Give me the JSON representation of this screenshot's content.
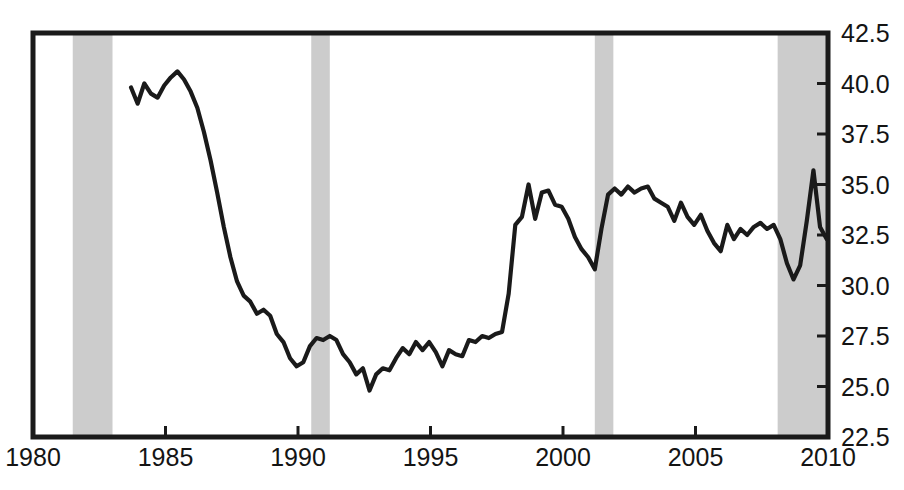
{
  "chart_data": {
    "type": "line",
    "title": "",
    "subtitle": "",
    "xlabel": "",
    "ylabel": "",
    "xlim": [
      1980,
      2010
    ],
    "ylim": [
      22.5,
      42.5
    ],
    "grid": false,
    "legend_position": "none",
    "x_ticks": [
      1980,
      1985,
      1990,
      1995,
      2000,
      2005,
      2010
    ],
    "x_tick_labels": [
      "1980",
      "1985",
      "1990",
      "1995",
      "2000",
      "2005",
      "2010"
    ],
    "y_ticks": [
      22.5,
      25.0,
      27.5,
      30.0,
      32.5,
      35.0,
      37.5,
      40.0,
      42.5
    ],
    "y_tick_labels": [
      "22.5",
      "25.0",
      "27.5",
      "30.0",
      "32.5",
      "35.0",
      "37.5",
      "40.0",
      "42.5"
    ],
    "y_axis_side": "right",
    "line_color": "#1a1a1a",
    "band_color": "#cccccc",
    "frame_color": "#1a1a1a",
    "background_color": "#ffffff",
    "shaded_regions": [
      {
        "name": "recession-1981-1982",
        "start": 1981.5,
        "end": 1983.0
      },
      {
        "name": "recession-1990-1991",
        "start": 1990.5,
        "end": 1991.2
      },
      {
        "name": "recession-2001",
        "start": 2001.2,
        "end": 2001.9
      },
      {
        "name": "recession-2007-2009",
        "start": 2008.1,
        "end": 2010.0
      }
    ],
    "series": [
      {
        "name": "series-1",
        "x": [
          1983.7,
          1983.95,
          1984.2,
          1984.45,
          1984.7,
          1984.95,
          1985.2,
          1985.45,
          1985.7,
          1985.95,
          1986.2,
          1986.45,
          1986.7,
          1986.95,
          1987.2,
          1987.45,
          1987.7,
          1987.95,
          1988.2,
          1988.45,
          1988.7,
          1988.95,
          1989.2,
          1989.45,
          1989.7,
          1989.95,
          1990.2,
          1990.45,
          1990.7,
          1990.95,
          1991.2,
          1991.45,
          1991.7,
          1991.95,
          1992.2,
          1992.45,
          1992.7,
          1992.95,
          1993.2,
          1993.45,
          1993.7,
          1993.95,
          1994.2,
          1994.45,
          1994.7,
          1994.95,
          1995.2,
          1995.45,
          1995.7,
          1995.95,
          1996.2,
          1996.45,
          1996.7,
          1996.95,
          1997.2,
          1997.45,
          1997.7,
          1997.95,
          1998.2,
          1998.45,
          1998.7,
          1998.95,
          1999.2,
          1999.45,
          1999.7,
          1999.95,
          2000.2,
          2000.45,
          2000.7,
          2000.95,
          2001.2,
          2001.45,
          2001.7,
          2001.95,
          2002.2,
          2002.45,
          2002.7,
          2002.95,
          2003.2,
          2003.45,
          2003.7,
          2003.95,
          2004.2,
          2004.45,
          2004.7,
          2004.95,
          2005.2,
          2005.45,
          2005.7,
          2005.95,
          2006.2,
          2006.45,
          2006.7,
          2006.95,
          2007.2,
          2007.45,
          2007.7,
          2007.95,
          2008.2,
          2008.45,
          2008.7,
          2008.95,
          2009.2,
          2009.45,
          2009.7,
          2009.95
        ],
        "y": [
          39.8,
          39.0,
          40.0,
          39.5,
          39.3,
          39.9,
          40.3,
          40.6,
          40.2,
          39.6,
          38.8,
          37.6,
          36.2,
          34.6,
          32.9,
          31.4,
          30.2,
          29.5,
          29.2,
          28.6,
          28.8,
          28.5,
          27.6,
          27.2,
          26.4,
          26.0,
          26.2,
          27.0,
          27.4,
          27.3,
          27.5,
          27.3,
          26.6,
          26.2,
          25.6,
          25.9,
          24.8,
          25.6,
          25.9,
          25.8,
          26.4,
          26.9,
          26.6,
          27.2,
          26.8,
          27.2,
          26.7,
          26.0,
          26.8,
          26.6,
          26.5,
          27.3,
          27.2,
          27.5,
          27.4,
          27.6,
          27.7,
          29.6,
          33.0,
          33.4,
          35.0,
          33.3,
          34.6,
          34.7,
          34.0,
          33.9,
          33.3,
          32.4,
          31.8,
          31.4,
          30.8,
          32.8,
          34.5,
          34.8,
          34.5,
          34.9,
          34.6,
          34.8,
          34.9,
          34.3,
          34.1,
          33.9,
          33.2,
          34.1,
          33.4,
          33.0,
          33.5,
          32.7,
          32.1,
          31.7,
          33.0,
          32.3,
          32.8,
          32.5,
          32.9,
          33.1,
          32.8,
          33.0,
          32.3,
          31.1,
          30.3,
          31.0,
          33.2,
          35.7,
          32.9,
          32.3
        ]
      }
    ]
  }
}
